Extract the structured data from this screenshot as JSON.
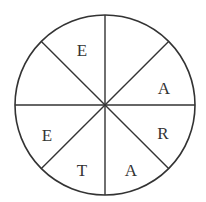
{
  "diagram": {
    "type": "spinner-wheel",
    "sections": 8,
    "colors": {
      "stroke": "#333333",
      "fill": "#ffffff",
      "text": "#333333"
    },
    "letters": [
      {
        "label": "E",
        "x": 82,
        "y": 56
      },
      {
        "label": "A",
        "x": 164,
        "y": 94
      },
      {
        "label": "R",
        "x": 163,
        "y": 139
      },
      {
        "label": "A",
        "x": 131,
        "y": 176
      },
      {
        "label": "T",
        "x": 82,
        "y": 176
      },
      {
        "label": "E",
        "x": 47,
        "y": 141
      }
    ],
    "empty_sections": 2
  }
}
